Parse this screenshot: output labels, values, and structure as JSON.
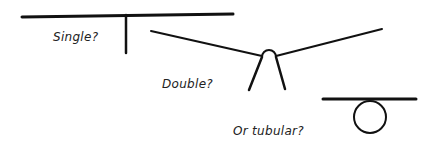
{
  "diagram": {
    "labels": {
      "single": "Single?",
      "double": "Double?",
      "tubular": "Or tubular?"
    },
    "stroke_color": "#111111",
    "text_color": "#222222"
  }
}
